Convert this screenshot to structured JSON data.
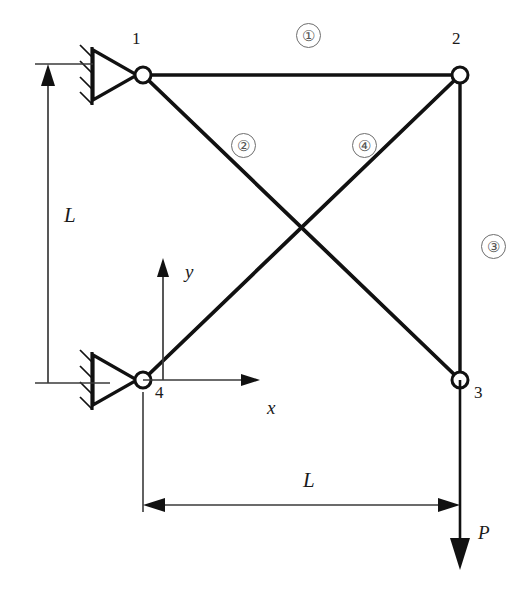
{
  "figure": {
    "stroke_color": "#111111",
    "thin_color": "#3a3a3a",
    "badge_color": "#555555"
  },
  "nodes": [
    {
      "id": "1",
      "label": "1",
      "x": 143,
      "y": 75,
      "label_x": 132,
      "label_y": 30,
      "support": "pin"
    },
    {
      "id": "2",
      "label": "2",
      "x": 460,
      "y": 75,
      "label_x": 452,
      "label_y": 30,
      "support": "none"
    },
    {
      "id": "3",
      "label": "3",
      "x": 460,
      "y": 380,
      "label_x": 474,
      "label_y": 384,
      "support": "none"
    },
    {
      "id": "4",
      "label": "4",
      "x": 143,
      "y": 380,
      "label_x": 155,
      "label_y": 384,
      "support": "pin"
    }
  ],
  "elements": [
    {
      "id": "1",
      "label": "①",
      "from": "1",
      "to": "2",
      "badge_x": 296,
      "badge_y": 23
    },
    {
      "id": "2",
      "label": "②",
      "from": "1",
      "to": "3",
      "badge_x": 231,
      "badge_y": 133
    },
    {
      "id": "3",
      "label": "③",
      "from": "2",
      "to": "3",
      "badge_x": 481,
      "badge_y": 234
    },
    {
      "id": "4",
      "label": "④",
      "from": "2",
      "to": "4",
      "badge_x": 352,
      "badge_y": 133
    }
  ],
  "dimensions": [
    {
      "name": "vertical-height",
      "label": "L",
      "orientation": "vertical",
      "label_x": 64,
      "label_y": 205
    },
    {
      "name": "horizontal-span",
      "label": "L",
      "orientation": "horizontal",
      "label_x": 303,
      "label_y": 470
    }
  ],
  "axes": {
    "origin_node": "4",
    "x_label": "x",
    "y_label": "y",
    "x_label_pos": {
      "x": 267,
      "y": 398
    },
    "y_label_pos": {
      "x": 185,
      "y": 262
    }
  },
  "load": {
    "label": "P",
    "direction": "down",
    "applied_at_node": "3",
    "label_x": 478,
    "label_y": 523
  },
  "icon_names": {
    "pin_support": "pin-support-icon",
    "hatch": "hatching-icon",
    "joint": "hinge-joint-icon",
    "arrow": "arrowhead-icon"
  }
}
